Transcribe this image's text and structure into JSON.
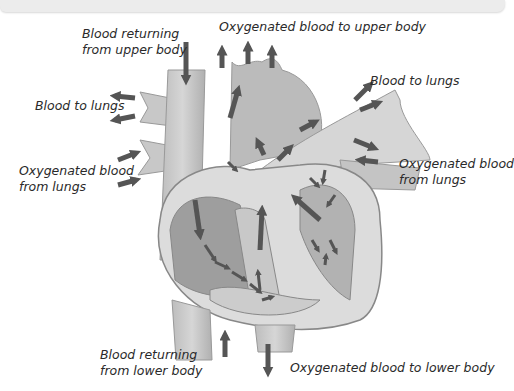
{
  "diagram": {
    "labels": {
      "upper_return": [
        "Blood returning",
        "from upper body"
      ],
      "upper_out": "Oxygenated blood to upper body",
      "lungs_left": "Blood to lungs",
      "lungs_right": "Blood to lungs",
      "from_lungs_left": [
        "Oxygenated blood",
        "from lungs"
      ],
      "from_lungs_right": [
        "Oxygenated blood",
        "from lungs"
      ],
      "lower_return": [
        "Blood returning",
        "from lower body"
      ],
      "lower_out": "Oxygenated blood to lower body"
    },
    "colors": {
      "arrow": "#555555",
      "vessel_light": "#cfcfcf",
      "vessel_mid": "#b4b4b4",
      "chamber_dark": "#9a9a9a",
      "outline": "#888888",
      "text": "#2a2a2a"
    }
  }
}
